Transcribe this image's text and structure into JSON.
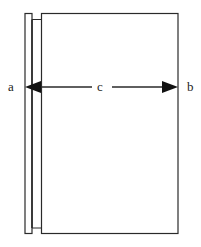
{
  "diagram": {
    "labels": {
      "a": "a",
      "b": "b",
      "c": "c"
    },
    "colors": {
      "line": "#2a2a2a",
      "background": "#ffffff"
    }
  }
}
